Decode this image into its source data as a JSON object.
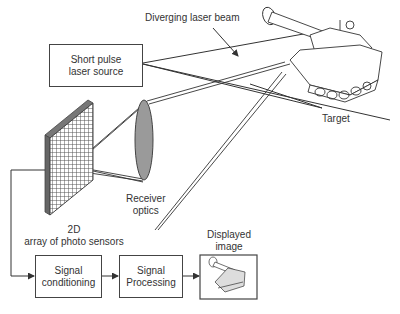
{
  "labels": {
    "beam": "Diverging laser beam",
    "target": "Target",
    "receiver_line1": "Receiver",
    "receiver_line2": "optics",
    "array_line1": "2D",
    "array_line2": "array of photo sensors",
    "displayed_line1": "Displayed",
    "displayed_line2": "image"
  },
  "boxes": {
    "laser_line1": "Short pulse",
    "laser_line2": "laser source",
    "conditioning_line1": "Signal",
    "conditioning_line2": "conditioning",
    "processing_line1": "Signal",
    "processing_line2": "Processing"
  },
  "icons": {
    "target": "tank-icon",
    "display": "tank-thumbnail-icon",
    "sensor": "sensor-grid-icon",
    "lens": "lens-icon"
  },
  "colors": {
    "line": "#333333",
    "lens_fill": "#9a9a9a",
    "grid_fill": "#8a8a8a"
  }
}
